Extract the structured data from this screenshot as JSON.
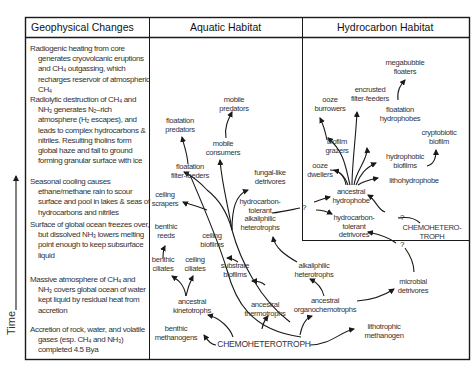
{
  "headers": {
    "geophysical": "Geophysical Changes",
    "aquatic": "Aquatic Habitat",
    "hydrocarbon": "Hydrocarbon Habitat"
  },
  "time_axis_label": "Time",
  "geophysical_events": [
    {
      "lines": [
        "Radiogenic heating from core generates cryovolcanic eruptions and CH₄ outgassing, which recharges reservoir of atmospheric CH₄"
      ]
    },
    {
      "lines": [
        "Radiolytic destruction of CH₄ and NH₃ generates N₂–rich atmosphere (H₂ escapes), and leads to complex hydrocarbons & nitriles. Resulting tholins form global haze and fall to ground forming granular surface with ice"
      ]
    },
    {
      "lines": [
        "Seasonal cooling causes ethane/methane rain to scour surface and pool in lakes & seas of hydrocarbons and nitriles"
      ]
    },
    {
      "lines": [
        "Surface of global ocean freezes over, but dissolved NH₃ lowers melting point enough to keep subsurface liquid"
      ]
    },
    {
      "lines": [
        "Massive atmosphere of CH₄ and NH₃ covers global ocean of water kept liquid by residual heat from accretion"
      ]
    },
    {
      "lines": [
        "Accretion of rock, water, and volatile gases (esp. CH₄ and NH₃) completed 4.5 Bya"
      ]
    }
  ],
  "aquatic_nodes": {
    "mobile_predators": "mobile\npredators",
    "floatation_predators": "floatation\npredators",
    "mobile_consumers": "mobile\nconsumers",
    "floatation_filter_feeders": "floatation\nfilter-feeders",
    "fungal_like_detrivores": "fungal-like\ndetrivores",
    "ceiling_scrapers": "ceiling\nscrapers",
    "hydrocarbon_tolerant_alkaliphilic_heterotrophs": "hydrocarbon-\ntolerant\nalkaliphilic\nheterotrophs",
    "benthic_reeds": "benthic\nreeds",
    "ceiling_biofilms": "ceiling\nbiofilms",
    "benthic_ciliates": "benthic\nciliates",
    "ceiling_ciliates": "ceiling\nciliates",
    "substrate_biofilms": "substrate\nbiofilms",
    "alkaliphilic_heterotrophs": "alkaliphilic\nheterotrophs",
    "ancestral_kinetotrophs": "ancestral\nkinetotrophs",
    "ancestral_thermotrophs": "ancestral\nthermotrophs",
    "ancestral_organochemotrophs": "ancestral\norganochemotrophs",
    "microbial_detrivores": "microbial\ndetrivores",
    "benthic_methanogens": "benthic\nmethanogens",
    "chemoheterotroph": "CHEMOHETEROTROPH",
    "lithotrophic_methanogen": "lithotrophic\nmethanogen"
  },
  "hydrocarbon_nodes": {
    "megabubble_floaters": "megabubble\nfloaters",
    "encrusted_filter_feeders": "encrusted\nfilter-feeders",
    "ooze_burrowers": "ooze\nburrowers",
    "floatation_hydrophobes": "floatation\nhydrophobes",
    "cryptobiotic_biofilm": "cryptobiotic\nbiofilm",
    "biofilm_grazers": "biofilm\ngrazers",
    "hydrophobic_biofilms": "hydrophobic\nbiofilms",
    "ooze_dwellers": "ooze\ndwellers",
    "lithohydrophobe": "lithohydrophobe",
    "ancestral_hydrophobe": "ancestral\nhydrophobe",
    "hydrocarbon_tolerant_detrivores": "hydrocarbon-\ntolerant\ndetrivores",
    "chemoheterotroph": "CHEMOHETERO-\nTROPH"
  },
  "uncertain_marker": "?",
  "colors": {
    "line": "#1a1a1a",
    "text": "#333333",
    "background": "#ffffff"
  }
}
